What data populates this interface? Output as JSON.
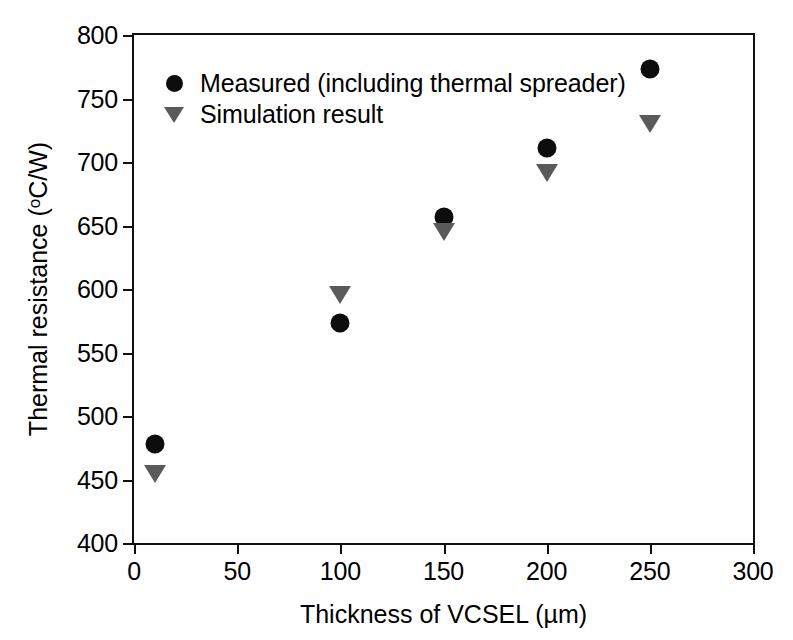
{
  "chart_data": {
    "type": "scatter",
    "title": "",
    "xlabel": "Thickness of VCSEL (µm)",
    "ylabel": "Thermal resistance (oC/W)",
    "ylabel_prefix": "Thermal resistance (",
    "ylabel_degree": "o",
    "ylabel_suffix": "C/W)",
    "xlim": [
      0,
      300
    ],
    "ylim": [
      400,
      800
    ],
    "xticks": [
      0,
      50,
      100,
      150,
      200,
      250,
      300
    ],
    "yticks": [
      400,
      450,
      500,
      550,
      600,
      650,
      700,
      750,
      800
    ],
    "xticklabels": [
      "0",
      "50",
      "100",
      "150",
      "200",
      "250",
      "300"
    ],
    "yticklabels": [
      "400",
      "450",
      "500",
      "550",
      "600",
      "650",
      "700",
      "750",
      "800"
    ],
    "grid": false,
    "legend_position": "upper left",
    "series": [
      {
        "name": "Measured (including thermal spreader)",
        "marker": "circle",
        "color": "#0d0d0d",
        "x": [
          10,
          100,
          150,
          200,
          250
        ],
        "values": [
          478,
          573,
          657,
          711,
          773
        ]
      },
      {
        "name": "Simulation result",
        "marker": "triangle-down",
        "color": "#5a5a5a",
        "x": [
          10,
          100,
          150,
          200,
          250
        ],
        "values": [
          454,
          595,
          645,
          691,
          730
        ]
      }
    ]
  },
  "legend": {
    "items": [
      {
        "label": "Measured (including thermal spreader)",
        "marker": "circle"
      },
      {
        "label": "Simulation result",
        "marker": "triangle-down"
      }
    ]
  }
}
